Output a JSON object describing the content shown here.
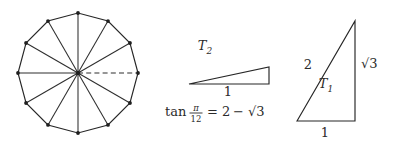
{
  "figure": {
    "background_color": "#ffffff",
    "line_color": "#262626"
  },
  "dodecagon": {
    "name": "regular-dodecagon",
    "sides": 12,
    "center": {
      "x": 78,
      "y": 73
    },
    "circumradius": 60,
    "rotation_deg": 15,
    "spokes": 12,
    "dashed_spoke_index": 0,
    "dashed_spoke_angle_deg": 0
  },
  "triangle_t2": {
    "label": "T",
    "label_sub": "2",
    "label_x": 205,
    "label_y": 50,
    "base_label": "1",
    "base_label_x": 228,
    "base_label_y": 96,
    "apex_left": {
      "x": 189,
      "y": 84
    },
    "corner_right_bottom": {
      "x": 269,
      "y": 84
    },
    "corner_right_top": {
      "x": 269,
      "y": 67
    }
  },
  "triangle_t1": {
    "label": "T",
    "label_sub": "1",
    "label_x": 326,
    "label_y": 88,
    "hypotenuse_label": "2",
    "hypotenuse_label_x": 308,
    "hypotenuse_label_y": 69,
    "vertical_label": "√3",
    "vertical_label_x": 361,
    "vertical_label_y": 68,
    "base_label": "1",
    "base_label_x": 325,
    "base_label_y": 137,
    "bottom_left": {
      "x": 297,
      "y": 121
    },
    "bottom_right": {
      "x": 355,
      "y": 121
    },
    "apex_top": {
      "x": 355,
      "y": 21
    }
  },
  "equation": {
    "full_text": "tan π/12 = 2 − √3",
    "function_name": "tan",
    "numerator": "π",
    "denominator": "12",
    "equals": "=",
    "right_term_1": "2",
    "minus": "−",
    "radical": "√3",
    "x": 165,
    "baseline_y": 116
  }
}
